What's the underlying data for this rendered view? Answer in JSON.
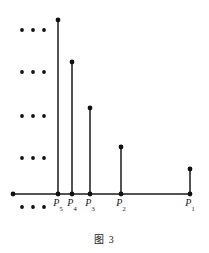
{
  "figure": {
    "caption": "图 3",
    "axis": {
      "x_start": 13,
      "x_end": 190,
      "y": 194,
      "left_end_dot": true
    },
    "points": [
      {
        "label": "P",
        "subscript": "1",
        "x": 190,
        "baseline_y": 194,
        "top_y": 169,
        "stem_height": 25,
        "label_x": 190,
        "label_y": 198
      },
      {
        "label": "P",
        "subscript": "2",
        "x": 121,
        "baseline_y": 194,
        "top_y": 147,
        "stem_height": 47,
        "label_x": 121,
        "label_y": 198
      },
      {
        "label": "P",
        "subscript": "3",
        "x": 90,
        "baseline_y": 194,
        "top_y": 108,
        "stem_height": 86,
        "label_x": 90,
        "label_y": 198
      },
      {
        "label": "P",
        "subscript": "4",
        "x": 72,
        "baseline_y": 194,
        "top_y": 62,
        "stem_height": 132,
        "label_x": 72,
        "label_y": 198
      },
      {
        "label": "P",
        "subscript": "5",
        "x": 58,
        "baseline_y": 194,
        "top_y": 20,
        "stem_height": 174,
        "label_x": 58,
        "label_y": 198
      }
    ],
    "ellipsis_rows": [
      {
        "y": 30,
        "xs": [
          22,
          33,
          44
        ]
      },
      {
        "y": 72,
        "xs": [
          22,
          33,
          44
        ]
      },
      {
        "y": 116,
        "xs": [
          22,
          33,
          44
        ]
      },
      {
        "y": 158,
        "xs": [
          22,
          33,
          44
        ]
      }
    ],
    "baseline_ellipsis": {
      "y": 207,
      "xs": [
        22,
        33,
        44
      ]
    },
    "dot_radius": 2.4,
    "ellipsis_dot_radius": 1.9,
    "colors": {
      "ink": "#111111",
      "line": "#1a1a1a",
      "background": "#ffffff"
    }
  }
}
